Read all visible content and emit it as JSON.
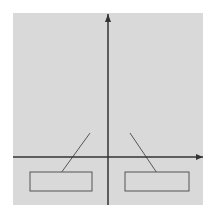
{
  "chart_data": {
    "type": "line",
    "title": "",
    "xlabel": "x",
    "ylabel": "f(x)",
    "grid": true,
    "series": [
      {
        "name": "f(x) = 2x^2",
        "style": "solid",
        "expr": "2x^2"
      },
      {
        "name": "f(x) = x^2",
        "style": "dashed",
        "expr": "x^2"
      }
    ],
    "xlim": [
      -6,
      6
    ],
    "ylim": [
      -3,
      9
    ]
  },
  "labels": {
    "yaxis": "f(x)",
    "xaxis": "x",
    "left_box": "f(x) = 2x",
    "right_box": "f(x) = x",
    "exp": "2"
  },
  "colors": {
    "grid_bg": "#d9d9d9",
    "grid_line": "#8a8a8a",
    "curve": "#222222"
  }
}
